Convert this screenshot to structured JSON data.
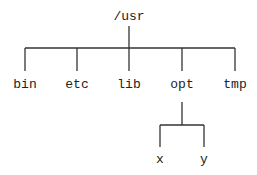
{
  "diagram": {
    "type": "directory-tree",
    "root": {
      "label": "/usr",
      "x": 129,
      "y": 10
    },
    "children": [
      {
        "label": "bin",
        "x": 25,
        "y": 78
      },
      {
        "label": "etc",
        "x": 77,
        "y": 78
      },
      {
        "label": "lib",
        "x": 129,
        "y": 78
      },
      {
        "label": "opt",
        "x": 182,
        "y": 78
      },
      {
        "label": "tmp",
        "x": 235,
        "y": 78
      }
    ],
    "grandchildren_of_opt": [
      {
        "label": "x",
        "x": 160,
        "y": 155
      },
      {
        "label": "y",
        "x": 204,
        "y": 155
      }
    ],
    "line_color": "#333333"
  }
}
